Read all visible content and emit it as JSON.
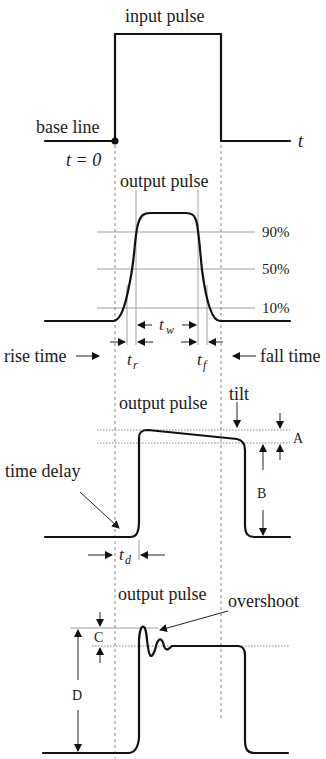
{
  "diagram": {
    "type": "pulse-characteristics",
    "panels": [
      {
        "id": "input",
        "title": "input pulse",
        "labels": {
          "baseline": "base line",
          "t0": "t = 0",
          "axis": "t"
        }
      },
      {
        "id": "output-rise-fall",
        "title": "output pulse",
        "levels": [
          "90%",
          "50%",
          "10%"
        ],
        "labels": {
          "rise": "rise time",
          "fall": "fall time",
          "tr_main": "t",
          "tr_sub": "r",
          "tf_main": "t",
          "tf_sub": "f",
          "tw_main": "t",
          "tw_sub": "w"
        }
      },
      {
        "id": "output-tilt",
        "title": "output pulse",
        "labels": {
          "tilt": "tilt",
          "A": "A",
          "B": "B",
          "delay": "time delay",
          "td_main": "t",
          "td_sub": "d"
        }
      },
      {
        "id": "output-overshoot",
        "title": "output pulse",
        "labels": {
          "overshoot": "overshoot",
          "C": "C",
          "D": "D"
        }
      }
    ]
  }
}
